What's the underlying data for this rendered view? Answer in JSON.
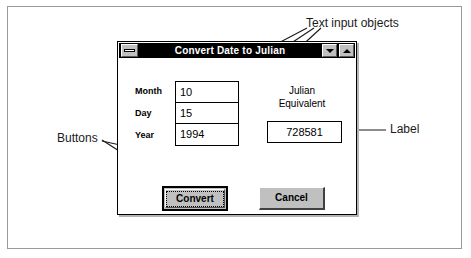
{
  "window": {
    "title": "Convert Date to Julian",
    "system_menu_icon": "minimize-box-icon",
    "minimize_icon": "triangle-down-icon",
    "maximize_icon": "triangle-up-icon"
  },
  "form": {
    "fields": [
      {
        "label": "Month",
        "value": "10"
      },
      {
        "label": "Day",
        "value": "15"
      },
      {
        "label": "Year",
        "value": "1994"
      }
    ],
    "result": {
      "label_line1": "Julian",
      "label_line2": "Equivalent",
      "value": "728581"
    }
  },
  "buttons": {
    "convert": "Convert",
    "cancel": "Cancel"
  },
  "annotations": {
    "text_input_objects": "Text input objects",
    "buttons": "Buttons",
    "label": "Label"
  },
  "colors": {
    "title_bar": "#000000",
    "title_text": "#ffffff",
    "button_face": "#c0c0c0",
    "window_face": "#ffffff",
    "frame": "#000000",
    "annotation_text": "#1a1a1a"
  }
}
